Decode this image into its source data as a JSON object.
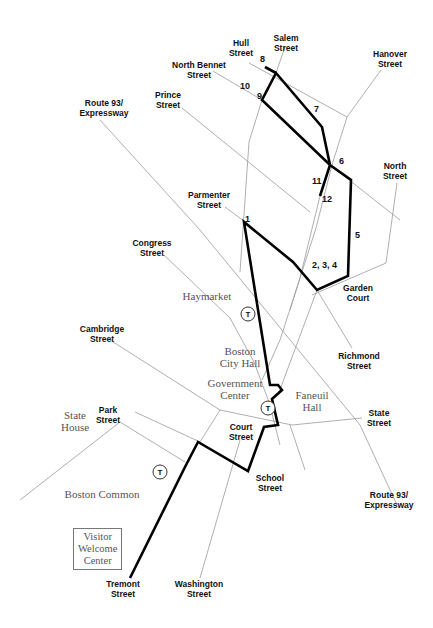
{
  "map": {
    "title": "Freedom Trail walking route map",
    "colors": {
      "route": "#000000",
      "streets": "#9a9a9a",
      "place_text": "#555555",
      "street_text": "#111111"
    },
    "streets": [
      {
        "name": "Hull Street",
        "label": "Hull\nStreet"
      },
      {
        "name": "Salem Street",
        "label": "Salem\nStreet"
      },
      {
        "name": "North Bennet Street",
        "label": "North Bennet\nStreet"
      },
      {
        "name": "Hanover Street",
        "label": "Hanover\nStreet"
      },
      {
        "name": "Route 93 / Expressway (north)",
        "label": "Route 93/\nExpressway"
      },
      {
        "name": "Prince Street",
        "label": "Prince\nStreet"
      },
      {
        "name": "North Street",
        "label": "North\nStreet"
      },
      {
        "name": "Parmenter Street",
        "label": "Parmenter\nStreet"
      },
      {
        "name": "Congress Street",
        "label": "Congress\nStreet"
      },
      {
        "name": "Garden Court",
        "label": "Garden\nCourt"
      },
      {
        "name": "Cambridge Street",
        "label": "Cambridge\nStreet"
      },
      {
        "name": "Richmond Street",
        "label": "Richmond\nStreet"
      },
      {
        "name": "Park Street",
        "label": "Park\nStreet"
      },
      {
        "name": "Court Street",
        "label": "Court\nStreet"
      },
      {
        "name": "State Street",
        "label": "State\nStreet"
      },
      {
        "name": "School Street",
        "label": "School\nStreet"
      },
      {
        "name": "Route 93 / Expressway (south)",
        "label": "Route 93/\nExpressway"
      },
      {
        "name": "Tremont Street",
        "label": "Tremont\nStreet"
      },
      {
        "name": "Washington Street",
        "label": "Washington\nStreet"
      }
    ],
    "places": [
      {
        "name": "Haymarket",
        "label": "Haymarket"
      },
      {
        "name": "Boston City Hall",
        "label": "Boston\nCity Hall"
      },
      {
        "name": "Government Center",
        "label": "Government\nCenter"
      },
      {
        "name": "Faneuil Hall",
        "label": "Faneuil\nHall"
      },
      {
        "name": "State House",
        "label": "State\nHouse"
      },
      {
        "name": "Boston Common",
        "label": "Boston Common"
      },
      {
        "name": "Visitor Welcome Center",
        "label": "Visitor\nWelcome\nCenter"
      }
    ],
    "t_stops": [
      {
        "name": "Haymarket T",
        "symbol": "T"
      },
      {
        "name": "Government Center T",
        "symbol": "T"
      },
      {
        "name": "Park Street T",
        "symbol": "T"
      }
    ],
    "stops": [
      {
        "id": "1",
        "label": "1"
      },
      {
        "id": "2-3-4",
        "label": "2, 3, 4"
      },
      {
        "id": "5",
        "label": "5"
      },
      {
        "id": "6",
        "label": "6"
      },
      {
        "id": "7",
        "label": "7"
      },
      {
        "id": "8",
        "label": "8"
      },
      {
        "id": "9",
        "label": "9"
      },
      {
        "id": "10",
        "label": "10"
      },
      {
        "id": "11",
        "label": "11"
      },
      {
        "id": "12",
        "label": "12"
      }
    ]
  }
}
